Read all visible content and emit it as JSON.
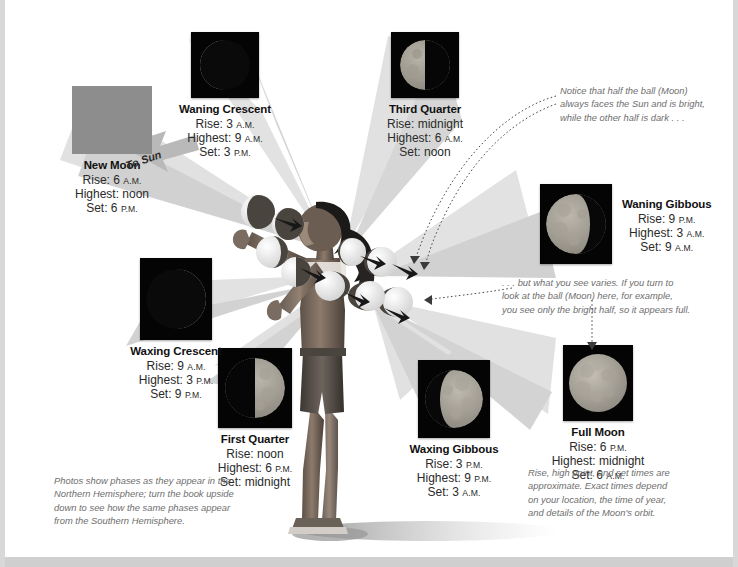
{
  "diagram": {
    "center_figure": "person-holding-balls",
    "sun_label": "To Sun",
    "background_color": "#ffffff",
    "ray_color": "#d9d9d9",
    "new_moon_swatch_color": "#8d8d8d"
  },
  "phases": [
    {
      "id": "new-moon",
      "name": "New Moon",
      "rise": "Rise: 6 A.M.",
      "rise_time": "6",
      "rise_period": "A.M.",
      "highest": "Highest: noon",
      "set": "Set: 6 P.M.",
      "set_time": "6",
      "set_period": "P.M.",
      "illumination": 0.0,
      "lit_side": "none",
      "photo": "blank-gray-swatch"
    },
    {
      "id": "waning-crescent",
      "name": "Waning Crescent",
      "rise": "Rise: 3 A.M.",
      "rise_time": "3",
      "rise_period": "A.M.",
      "highest": "Highest: 9 A.M.",
      "highest_time": "9",
      "highest_period": "A.M.",
      "set": "Set: 3 P.M.",
      "set_time": "3",
      "set_period": "P.M.",
      "illumination": 0.15,
      "lit_side": "left",
      "photo": "moon-waning-crescent"
    },
    {
      "id": "third-quarter",
      "name": "Third Quarter",
      "rise": "Rise: midnight",
      "highest": "Highest: 6 A.M.",
      "highest_time": "6",
      "highest_period": "A.M.",
      "set": "Set: noon",
      "illumination": 0.5,
      "lit_side": "left",
      "photo": "moon-third-quarter"
    },
    {
      "id": "waning-gibbous",
      "name": "Waning Gibbous",
      "rise": "Rise: 9 P.M.",
      "rise_time": "9",
      "rise_period": "P.M.",
      "highest": "Highest: 3 A.M.",
      "highest_time": "3",
      "highest_period": "A.M.",
      "set": "Set: 9 A.M.",
      "set_time": "9",
      "set_period": "A.M.",
      "illumination": 0.78,
      "lit_side": "left",
      "photo": "moon-waning-gibbous"
    },
    {
      "id": "full-moon",
      "name": "Full Moon",
      "rise": "Rise: 6 P.M.",
      "rise_time": "6",
      "rise_period": "P.M.",
      "highest": "Highest: midnight",
      "set": "Set: 6 A.M.",
      "set_time": "6",
      "set_period": "A.M.",
      "illumination": 1.0,
      "lit_side": "full",
      "photo": "moon-full"
    },
    {
      "id": "waxing-gibbous",
      "name": "Waxing Gibbous",
      "rise": "Rise: 3 P.M.",
      "rise_time": "3",
      "rise_period": "P.M.",
      "highest": "Highest: 9 P.M.",
      "highest_time": "9",
      "highest_period": "P.M.",
      "set": "Set: 3 A.M.",
      "set_time": "3",
      "set_period": "A.M.",
      "illumination": 0.78,
      "lit_side": "right",
      "photo": "moon-waxing-gibbous"
    },
    {
      "id": "first-quarter",
      "name": "First Quarter",
      "rise": "Rise: noon",
      "highest": "Highest: 6 P.M.",
      "highest_time": "6",
      "highest_period": "P.M.",
      "set": "Set: midnight",
      "illumination": 0.5,
      "lit_side": "right",
      "photo": "moon-first-quarter"
    },
    {
      "id": "waxing-crescent",
      "name": "Waxing Crescent",
      "rise": "Rise: 9 A.M.",
      "rise_time": "9",
      "rise_period": "A.M.",
      "highest": "Highest: 3 P.M.",
      "highest_time": "3",
      "highest_period": "P.M.",
      "set": "Set: 9 P.M.",
      "set_time": "9",
      "set_period": "P.M.",
      "illumination": 0.15,
      "lit_side": "right",
      "photo": "moon-waxing-crescent"
    }
  ],
  "annotations": {
    "top_right": {
      "line1": "Notice that half the ball (Moon)",
      "line2": "always faces the Sun and is bright,",
      "line3": "while the other half is dark . . ."
    },
    "middle_right": {
      "line1": ". . . but what you see varies. If you turn to",
      "line2": "look at the ball (Moon) here, for example,",
      "line3": "you see only the bright half, so it appears full."
    },
    "bottom_left": {
      "line1": "Photos show phases as they appear in the",
      "line2": "Northern Hemisphere; turn the book upside",
      "line3": "down to see how the same phases appear",
      "line4": "from the Southern Hemisphere."
    },
    "bottom_right": {
      "line1": "Rise, high point, and set times are",
      "line2": "approximate. Exact times depend",
      "line3": "on your location, the time of year,",
      "line4": "and details of the Moon's orbit."
    }
  }
}
